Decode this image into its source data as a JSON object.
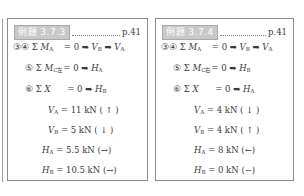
{
  "panels": [
    {
      "badge": "例題 3.7.3",
      "page": "p.41",
      "equations": [
        {
          "num": "③④",
          "sym": "Σ",
          "var": "M",
          "sub": "A",
          "pad": "  ",
          "eq": "= 0",
          "arrow1": "➡",
          "r1": "V",
          "r1sub": "B",
          "arrow2": "➡",
          "r2": "V",
          "r2sub": "A"
        },
        {
          "num": "⑤",
          "sym": "Σ",
          "var": "M",
          "sub": "C左",
          "pad": "",
          "eq": "= 0",
          "arrow1": "➡",
          "r1": "H",
          "r1sub": "A"
        },
        {
          "num": "⑥",
          "sym": "Σ",
          "var": "X",
          "sub": "",
          "pad": "    ",
          "eq": "= 0",
          "arrow1": "➡",
          "r1": "H",
          "r1sub": "B"
        }
      ],
      "results": [
        {
          "var": "V",
          "sub": "A",
          "value": "= 11 kN",
          "dir": "( ↑ )"
        },
        {
          "var": "V",
          "sub": "B",
          "value": "= 5 kN",
          "dir": "( ↓ )"
        },
        {
          "var": "H",
          "sub": "A",
          "value": "= 5.5 kN",
          "dir": "(→)"
        },
        {
          "var": "H",
          "sub": "B",
          "value": "= 10.5 kN",
          "dir": "(→)"
        }
      ]
    },
    {
      "badge": "例題 3.7.4",
      "page": "p.41",
      "equations": [
        {
          "num": "③④",
          "sym": "Σ",
          "var": "M",
          "sub": "A",
          "pad": "  ",
          "eq": "= 0",
          "arrow1": "➡",
          "r1": "V",
          "r1sub": "B",
          "arrow2": "➡",
          "r2": "V",
          "r2sub": "A"
        },
        {
          "num": "⑤",
          "sym": "Σ",
          "var": "M",
          "sub": "C右",
          "pad": "",
          "eq": "= 0",
          "arrow1": "➡",
          "r1": "H",
          "r1sub": "B"
        },
        {
          "num": "⑥",
          "sym": "Σ",
          "var": "X",
          "sub": "",
          "pad": "    ",
          "eq": "= 0",
          "arrow1": "➡",
          "r1": "H",
          "r1sub": "A"
        }
      ],
      "results": [
        {
          "var": "V",
          "sub": "A",
          "value": "= 4 kN",
          "dir": "( ↓ )"
        },
        {
          "var": "V",
          "sub": "B",
          "value": "= 4 kN",
          "dir": "( ↑ )"
        },
        {
          "var": "H",
          "sub": "A",
          "value": "= 8 kN",
          "dir": "(←)"
        },
        {
          "var": "H",
          "sub": "B",
          "value": "= 0 kN",
          "dir": "(−)"
        }
      ]
    }
  ]
}
